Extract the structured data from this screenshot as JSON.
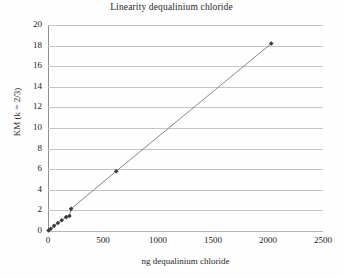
{
  "chart_data": {
    "type": "scatter",
    "title": "Linearity dequalinium chloride",
    "xlabel": "ng dequalinium chloride",
    "ylabel": "KM (k = 2/3)",
    "xlim": [
      0,
      2500
    ],
    "ylim": [
      0,
      20
    ],
    "xticks": [
      0,
      500,
      1000,
      1500,
      2000,
      2500
    ],
    "yticks": [
      0,
      2,
      4,
      6,
      8,
      10,
      12,
      14,
      16,
      18,
      20
    ],
    "grid": "horizontal",
    "legend": "none",
    "marker": "diamond",
    "marker_color": "#3a3a3a",
    "line_color": "#7a7a7a",
    "x": [
      5,
      25,
      55,
      90,
      125,
      165,
      195,
      210,
      620,
      2030
    ],
    "y": [
      0.05,
      0.22,
      0.5,
      0.78,
      1.05,
      1.35,
      1.45,
      2.15,
      5.8,
      18.2
    ],
    "points": [
      {
        "x": 5,
        "y": 0.05
      },
      {
        "x": 25,
        "y": 0.22
      },
      {
        "x": 55,
        "y": 0.5
      },
      {
        "x": 90,
        "y": 0.78
      },
      {
        "x": 125,
        "y": 1.05
      },
      {
        "x": 165,
        "y": 1.35
      },
      {
        "x": 195,
        "y": 1.45
      },
      {
        "x": 210,
        "y": 2.15
      },
      {
        "x": 620,
        "y": 5.8
      },
      {
        "x": 2030,
        "y": 18.2
      }
    ]
  }
}
